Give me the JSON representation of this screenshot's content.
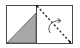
{
  "diagram": {
    "icon": "reflect-diagonal-icon",
    "colors": {
      "outline": "#3a3a3a",
      "fill": "#a8a8a8",
      "dashed_line": "#2e2e2e",
      "arrow": "#555555",
      "background": "#ffffff"
    },
    "left_panel": {
      "shape": "right-triangle",
      "filled": true
    },
    "right_panel": {
      "line": "dashed-diagonal",
      "arrow": "curved-rotation-arrow"
    }
  }
}
